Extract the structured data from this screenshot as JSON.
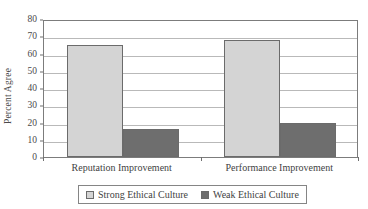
{
  "chart_data": {
    "type": "bar",
    "title": "",
    "subtitle": "",
    "xlabel": "",
    "ylabel": "Percent Agree",
    "ylim": [
      0,
      80
    ],
    "ytick_step": 10,
    "yticks": [
      0,
      10,
      20,
      30,
      40,
      50,
      60,
      70,
      80
    ],
    "ytick_labels": [
      "0",
      "10",
      "20",
      "30",
      "40",
      "50",
      "60",
      "70",
      "80"
    ],
    "grid": true,
    "grid_axis": "y",
    "legend_position": "bottom-center",
    "categories": [
      "Reputation Improvement",
      "Performance Improvement"
    ],
    "series": [
      {
        "name": "Strong Ethical Culture",
        "color": "#d4d4d4",
        "values": [
          65,
          68
        ]
      },
      {
        "name": "Weak Ethical Culture",
        "color": "#6e6e6e",
        "values": [
          16.5,
          20
        ]
      }
    ],
    "annotations": []
  },
  "style": {
    "bar_border_color": "#6b6b6b",
    "gridline_color": "#b9b9b9",
    "axis_color": "#7c7c7c",
    "text_color": "#3f3f3f",
    "background": "#ffffff"
  }
}
